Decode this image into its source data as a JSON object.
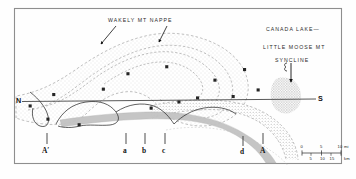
{
  "figure": {
    "type": "geologic-map",
    "title_labels": {
      "nappe": "WAKELY MT NAPPE",
      "canada_lake": "CANADA LAKE—",
      "little_moose": "LITTLE MOOSE MT",
      "syncline": "SYNCLINE"
    },
    "section_line": {
      "north_label": "N",
      "south_label": "S"
    },
    "tick_labels": [
      "A′",
      "a",
      "b",
      "c",
      "d",
      "A"
    ],
    "scale_bar": {
      "miles": [
        "0",
        "5",
        "10"
      ],
      "miles_unit": "mi",
      "km": [
        "5",
        "10",
        "15"
      ],
      "km_unit": "km"
    },
    "colors": {
      "ink": "#1a1a1a",
      "frame": "#8a8a8a",
      "stipple": "#b9b9b9",
      "band": "#bdbdbd",
      "contact": "#6e6e6e"
    }
  }
}
